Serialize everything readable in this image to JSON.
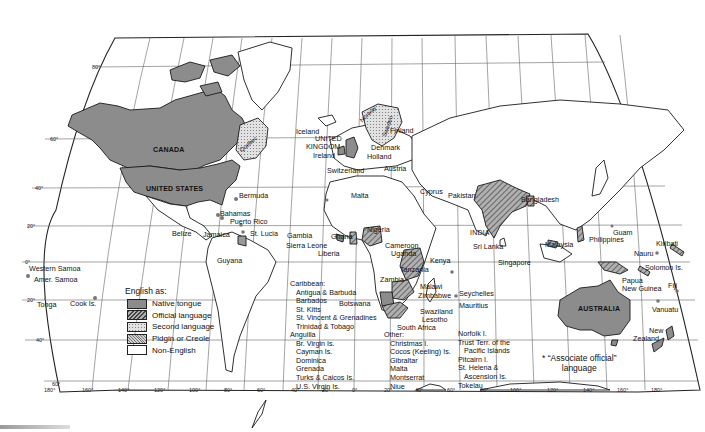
{
  "map": {
    "title": "English as a world language",
    "colors": {
      "native": "#8c8c8c",
      "official": "#9a9a9a",
      "second": "#d4d4d4",
      "pidgin": "#bdbdbd",
      "non_english": "#ffffff",
      "outline": "#1a1a1a",
      "grid": "#555555"
    },
    "legend": {
      "title": "English as:",
      "items": [
        {
          "label": "Native tongue",
          "pattern": "solid-dark"
        },
        {
          "label": "Official language",
          "pattern": "hatch-dense"
        },
        {
          "label": "Second language",
          "pattern": "dots-light"
        },
        {
          "label": "Pidgin or Creole",
          "pattern": "crosshatch"
        },
        {
          "label": "Non-English",
          "pattern": "blank"
        }
      ]
    },
    "associate_note": {
      "symbol": "*",
      "line1": "“Associate official”",
      "line2": "language"
    },
    "latitude_ticks": [
      "80°",
      "60°",
      "40°",
      "20°",
      "0°",
      "20°",
      "40°",
      "60°"
    ],
    "longitude_ticks": [
      "180°",
      "160°",
      "140°",
      "120°",
      "100°",
      "80°",
      "60°",
      "40°",
      "20°",
      "0°",
      "20°",
      "40°",
      "60°",
      "80°",
      "100°",
      "120°",
      "140°",
      "160°",
      "180°"
    ],
    "country_labels": {
      "canada": "CANADA",
      "united_states": "UNITED STATES",
      "quebec": "Quebec",
      "australia": "AUSTRALIA",
      "india": "INDIA",
      "iceland": "Iceland",
      "united_kingdom_1": "UNITED",
      "united_kingdom_2": "KINGDOM",
      "ireland": "Ireland",
      "norway": "Norway",
      "sweden": "Sweden",
      "finland": "Finland",
      "denmark": "Denmark",
      "holland": "Holland",
      "austria": "Austria",
      "switzerland": "Switzerland",
      "malta": "Malta",
      "cyprus": "Cyprus",
      "pakistan": "Pakistan",
      "bangladesh": "Bangladesh",
      "sri_lanka": "Sri Lanka",
      "singapore": "Singapore",
      "malaysia": "Malaysia",
      "philippines": "Philippines",
      "guam": "Guam",
      "kiribati": "Kiribati",
      "nauru": "Nauru",
      "solomon": "Solomon Is.",
      "papua_1": "Papua",
      "papua_2": "New Guinea",
      "fiji": "Fiji",
      "vanuatu": "Vanuatu",
      "new_zealand_1": "New",
      "new_zealand_2": "Zealand",
      "bermuda": "Bermuda",
      "bahamas": "Bahamas",
      "puerto_rico": "Puerto Rico",
      "st_lucia": "St. Lucia",
      "jamaica": "Jamaica",
      "belize": "Belize",
      "guyana": "Guyana",
      "gambia": "Gambia",
      "ghana": "Ghana",
      "sierra_leone": "Sierra Leone",
      "liberia": "Liberia",
      "nigeria": "Nigeria",
      "cameroon": "Cameroon",
      "uganda": "Uganda",
      "kenya": "Kenya",
      "tanzania": "Tanzania",
      "zambia": "Zambia",
      "malawi": "Malawi",
      "zimbabwe": "Zimbabwe",
      "botswana": "Botswana",
      "swaziland": "Swaziland",
      "lesotho": "Lesotho",
      "south_africa": "South Africa",
      "seychelles": "Seychelles",
      "mauritius": "Mauritius",
      "western_samoa": "Western Samoa",
      "amer_samoa": "Amer. Samoa",
      "tonga": "Tonga",
      "cook": "Cook Is."
    },
    "caribbean_list": {
      "head": "Caribbean:",
      "items": [
        "Antigua & Barbuda",
        "Barbados",
        "St. Kitts",
        "St. Vincent & Grenadines",
        "Trinidad & Tobago"
      ]
    },
    "anguilla_list": {
      "items": [
        "Anguilla",
        "Br. Virgin Is.",
        "Cayman Is.",
        "Dominica",
        "Grenada",
        "Turks & Caicos Is.",
        "U.S. Virgin Is."
      ]
    },
    "other_list": {
      "head": "Other:",
      "items": [
        "Christmas I.",
        "Cocos (Keeling) Is.",
        "Gibraltar",
        "Malta",
        "Montserrat",
        "Niue"
      ]
    },
    "pacific_list": {
      "items": [
        "Norfolk I.",
        "Trust Terr. of the",
        "Pacific Islands",
        "Pitcairn I.",
        "St. Helena &",
        "Ascension Is.",
        "Tokelau"
      ]
    }
  }
}
